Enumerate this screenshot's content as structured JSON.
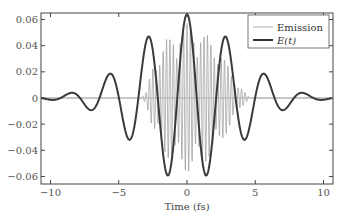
{
  "chart_data": {
    "type": "line",
    "title": "",
    "xlabel": "Time (fs)",
    "ylabel": "",
    "xlim": [
      -11,
      10.5
    ],
    "ylim": [
      -0.065,
      0.065
    ],
    "x_ticks": [
      -10,
      -5,
      0,
      5,
      10
    ],
    "x_tick_labels": [
      "−10",
      "−5",
      "0",
      "5",
      "10"
    ],
    "y_ticks": [
      0.06,
      0.04,
      0.02,
      0,
      -0.02,
      -0.04,
      -0.06
    ],
    "y_tick_labels": [
      "0.06",
      "0.04",
      "0.02",
      "0",
      "−0.02",
      "−0.04",
      "−0.06"
    ],
    "grid": false,
    "legend_position": "upper right",
    "series": [
      {
        "name": "Emission",
        "color": "#aaaaaa",
        "style": "thin high-frequency oscillation",
        "envelope_points": [
          [
            -3.5,
            0.0
          ],
          [
            -3.0,
            0.004
          ],
          [
            -2.4,
            0.03
          ],
          [
            -1.5,
            0.045
          ],
          [
            -0.5,
            0.055
          ],
          [
            0.3,
            0.058
          ],
          [
            1.2,
            0.05
          ],
          [
            2.0,
            0.045
          ],
          [
            3.0,
            0.025
          ],
          [
            3.8,
            0.01
          ],
          [
            4.6,
            0.0
          ]
        ],
        "carrier_period_fs": 0.25
      },
      {
        "name": "E(t)",
        "color": "#333333",
        "style": "thick",
        "x": [
          -10,
          -9,
          -8.5,
          -7.5,
          -6.3,
          -5.2,
          -4.1,
          -2.8,
          -1.4,
          0,
          1.4,
          2.8,
          4.1,
          5.2,
          6.3,
          7.5,
          8.5,
          9,
          10
        ],
        "values": [
          0.0,
          -0.001,
          -0.002,
          0.004,
          -0.01,
          0.02,
          -0.034,
          0.049,
          -0.063,
          0.064,
          -0.062,
          0.049,
          -0.034,
          0.02,
          -0.01,
          0.004,
          -0.002,
          -0.001,
          0.0
        ]
      }
    ],
    "model": {
      "E_amplitude": 0.064,
      "E_sigma_fs": 3.6,
      "E_period_fs": 2.85
    }
  },
  "legend": {
    "items": [
      {
        "label": "Emission",
        "color": "#aaaaaa"
      },
      {
        "label": "E(t)",
        "color": "#333333"
      }
    ]
  }
}
